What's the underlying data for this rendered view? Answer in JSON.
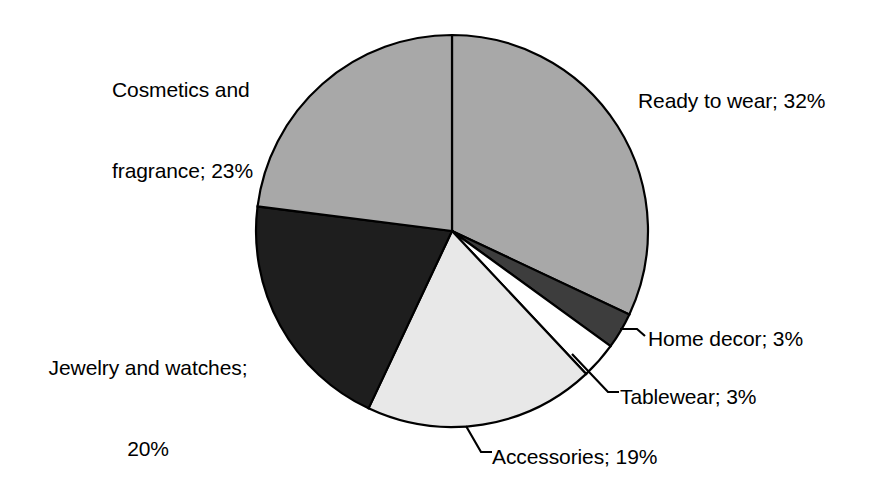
{
  "chart_data": {
    "type": "pie",
    "title": "",
    "subtitle": "",
    "xlabel": "",
    "ylabel": "",
    "legend_position": "none",
    "grid": false,
    "start_angle_deg": 0,
    "direction": "clockwise",
    "categories": [
      "Ready to wear",
      "Home decor",
      "Tablewear",
      "Accessories",
      "Jewelry and watches",
      "Cosmetics and fragrance"
    ],
    "values": [
      32,
      3,
      3,
      19,
      20,
      23
    ],
    "value_unit": "%",
    "colors": [
      "#a8a8a8",
      "#3d3d3d",
      "#ffffff",
      "#e8e8e8",
      "#1e1e1e",
      "#a8a8a8"
    ],
    "slices": [
      {
        "label": "Ready to wear",
        "value": 32,
        "display": "Ready to wear; 32%",
        "color": "#a8a8a8",
        "start_deg": 0,
        "end_deg": 115.2,
        "leader": false
      },
      {
        "label": "Home decor",
        "value": 3,
        "display": "Home decor; 3%",
        "color": "#3d3d3d",
        "start_deg": 115.2,
        "end_deg": 126.0,
        "leader": true
      },
      {
        "label": "Tablewear",
        "value": 3,
        "display": "Tablewear; 3%",
        "color": "#ffffff",
        "start_deg": 126.0,
        "end_deg": 136.8,
        "leader": true
      },
      {
        "label": "Accessories",
        "value": 19,
        "display": "Accessories; 19%",
        "color": "#e8e8e8",
        "start_deg": 136.8,
        "end_deg": 205.2,
        "leader": true
      },
      {
        "label": "Jewelry and watches",
        "value": 20,
        "display": "Jewelry and watches; 20%",
        "color": "#1e1e1e",
        "start_deg": 205.2,
        "end_deg": 277.2,
        "leader": false
      },
      {
        "label": "Cosmetics and fragrance",
        "value": 23,
        "display": "Cosmetics and fragrance; 23%",
        "color": "#a8a8a8",
        "start_deg": 277.2,
        "end_deg": 360.0,
        "leader": false
      }
    ]
  },
  "labels": {
    "cosmetics_line1": "Cosmetics and",
    "cosmetics_line2": "fragrance; 23%",
    "ready_to_wear": "Ready to wear; 32%",
    "home_decor": "Home decor; 3%",
    "tablewear": "Tablewear; 3%",
    "accessories": "Accessories; 19%",
    "jewelry_line1": "Jewelry and watches;",
    "jewelry_line2": "20%"
  },
  "style": {
    "background": "#ffffff",
    "outline": "#000000",
    "text": "#000000"
  }
}
